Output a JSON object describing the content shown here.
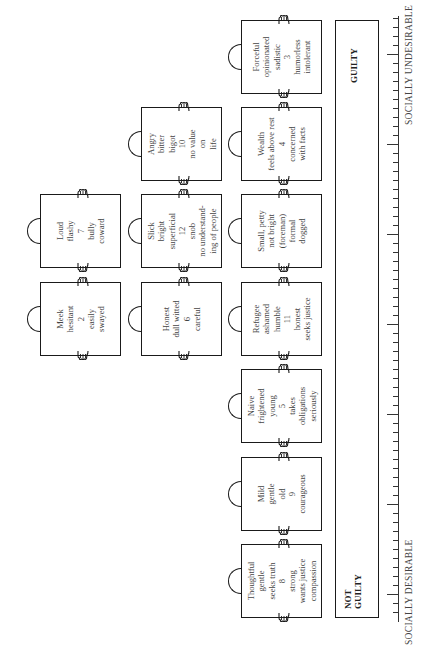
{
  "cards": [
    {
      "id": "forceful",
      "x": 241,
      "y": 20,
      "lines": [
        "Forceful",
        "opinionated",
        "sadistic",
        "3",
        "humorless",
        "intolerant"
      ]
    },
    {
      "id": "angry",
      "x": 141,
      "y": 107,
      "lines": [
        "Angry",
        "bitter",
        "bigot",
        "10",
        "no value",
        "on",
        "life"
      ]
    },
    {
      "id": "wealth",
      "x": 241,
      "y": 107,
      "lines": [
        "Wealth",
        "feels above rest",
        "4",
        "concerned",
        "with facts"
      ]
    },
    {
      "id": "loud",
      "x": 40,
      "y": 194,
      "lines": [
        "Loud",
        "flashy",
        "7",
        "bully",
        "coward"
      ]
    },
    {
      "id": "slick",
      "x": 141,
      "y": 194,
      "lines": [
        "Slick",
        "bright",
        "superficial",
        "12",
        "snob",
        "no understand-",
        "ing of people"
      ]
    },
    {
      "id": "small",
      "x": 241,
      "y": 194,
      "lines": [
        "Small, petty",
        "not bright",
        "(foreman)",
        "formal",
        "dogged"
      ]
    },
    {
      "id": "meek",
      "x": 40,
      "y": 282,
      "lines": [
        "Meek",
        "hesitant",
        "2",
        "easily",
        "swayed"
      ]
    },
    {
      "id": "honest",
      "x": 141,
      "y": 282,
      "lines": [
        "Honest",
        "dull witted",
        "6",
        "careful"
      ]
    },
    {
      "id": "refugee",
      "x": 241,
      "y": 282,
      "lines": [
        "Refugee",
        "ashamed",
        "humble",
        "11",
        "honest",
        "seeks justice"
      ]
    },
    {
      "id": "naive",
      "x": 241,
      "y": 369,
      "lines": [
        "Naive",
        "frightened",
        "young",
        "5",
        "takes",
        "obligations",
        "seriously"
      ]
    },
    {
      "id": "mild",
      "x": 241,
      "y": 457,
      "lines": [
        "Mild",
        "gentle",
        "old",
        "9",
        "courageous"
      ]
    },
    {
      "id": "thoughtful",
      "x": 241,
      "y": 544,
      "lines": [
        "Thoughtful",
        "gentle",
        "seeks truth",
        "8",
        "strong",
        "wants justice",
        "compassion"
      ]
    }
  ],
  "verdict": {
    "guilty_label": "GUILTY",
    "not_guilty_line1": "NOT",
    "not_guilty_line2": "GUILTY"
  },
  "scale": {
    "top_label": "SOCIALLY UNDESIRABLE",
    "bottom_label": "SOCIALLY DESIRABLE",
    "tick_spacing": 9,
    "long_every": 10
  },
  "icons": {
    "handle": "semicircle-handle-icon",
    "hand": "pointing-hand-icon"
  }
}
